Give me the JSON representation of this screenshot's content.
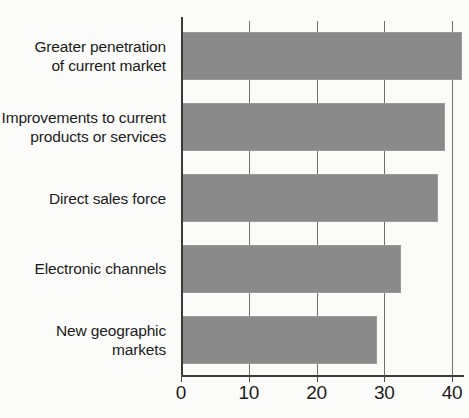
{
  "chart_data": {
    "type": "bar",
    "orientation": "horizontal",
    "title": "",
    "subtitle": "",
    "xlabel": "",
    "ylabel": "",
    "categories": [
      "Greater penetration\nof current market",
      "Improvements to current\nproducts or services",
      "Direct sales force",
      "Electronic channels",
      "New geographic\nmarkets"
    ],
    "values": [
      41.5,
      39,
      38,
      32.5,
      29
    ],
    "xlim": [
      0,
      40
    ],
    "xticks": [
      0,
      10,
      20,
      30,
      40
    ],
    "xtick_labels": [
      "0",
      "10",
      "20",
      "30",
      "40"
    ],
    "grid": "vertical",
    "legend": "none",
    "bar_color": "#8a8a8a",
    "axis_color": "#3a3a3a",
    "gridline_color": "#6f6f6f",
    "background_color": "#fbfbf9",
    "text_color": "#1c1c1c"
  }
}
